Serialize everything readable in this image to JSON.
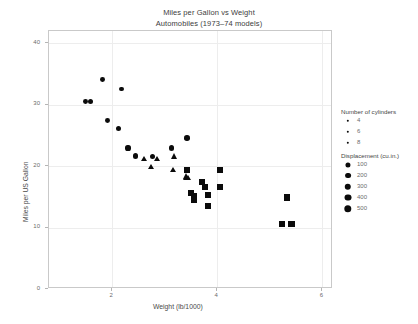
{
  "chart_data": {
    "type": "scatter",
    "title": "Miles per Gallon vs Weight",
    "subtitle": "Automobiles (1973–74 models)",
    "xlabel": "Weight (lb/1000)",
    "ylabel": "Miles per US Gallon",
    "xlim": [
      0.8,
      6.2
    ],
    "ylim": [
      0,
      42
    ],
    "xticks": [
      2,
      4,
      6
    ],
    "yticks": [
      0,
      10,
      20,
      30,
      40
    ],
    "grid": true,
    "encodings": {
      "shape": "cyl",
      "size": "disp"
    },
    "points": [
      {
        "wt": 1.513,
        "mpg": 30.4,
        "cyl": 4,
        "disp": 75.7
      },
      {
        "wt": 1.615,
        "mpg": 30.4,
        "cyl": 4,
        "disp": 95.1
      },
      {
        "wt": 1.835,
        "mpg": 33.9,
        "cyl": 4,
        "disp": 71.1
      },
      {
        "wt": 1.935,
        "mpg": 27.3,
        "cyl": 4,
        "disp": 79.0
      },
      {
        "wt": 2.14,
        "mpg": 26.0,
        "cyl": 4,
        "disp": 120.3
      },
      {
        "wt": 2.2,
        "mpg": 32.4,
        "cyl": 4,
        "disp": 78.7
      },
      {
        "wt": 2.32,
        "mpg": 22.8,
        "cyl": 4,
        "disp": 108.0
      },
      {
        "wt": 2.465,
        "mpg": 21.5,
        "cyl": 4,
        "disp": 120.1
      },
      {
        "wt": 2.62,
        "mpg": 21.0,
        "cyl": 6,
        "disp": 160.0
      },
      {
        "wt": 2.77,
        "mpg": 19.7,
        "cyl": 6,
        "disp": 145.0
      },
      {
        "wt": 2.78,
        "mpg": 21.4,
        "cyl": 4,
        "disp": 121.0
      },
      {
        "wt": 2.875,
        "mpg": 21.0,
        "cyl": 6,
        "disp": 160.0
      },
      {
        "wt": 3.15,
        "mpg": 22.8,
        "cyl": 4,
        "disp": 140.8
      },
      {
        "wt": 3.19,
        "mpg": 19.2,
        "cyl": 6,
        "disp": 167.6
      },
      {
        "wt": 3.215,
        "mpg": 21.4,
        "cyl": 6,
        "disp": 258.0
      },
      {
        "wt": 3.435,
        "mpg": 17.8,
        "cyl": 6,
        "disp": 167.6
      },
      {
        "wt": 3.44,
        "mpg": 24.4,
        "cyl": 4,
        "disp": 146.7
      },
      {
        "wt": 3.44,
        "mpg": 18.1,
        "cyl": 6,
        "disp": 225.0
      },
      {
        "wt": 3.44,
        "mpg": 19.2,
        "cyl": 8,
        "disp": 275.8
      },
      {
        "wt": 3.46,
        "mpg": 17.8,
        "cyl": 6,
        "disp": 167.6
      },
      {
        "wt": 3.52,
        "mpg": 15.5,
        "cyl": 8,
        "disp": 318.0
      },
      {
        "wt": 3.57,
        "mpg": 14.3,
        "cyl": 8,
        "disp": 360.0
      },
      {
        "wt": 3.57,
        "mpg": 15.0,
        "cyl": 8,
        "disp": 301.0
      },
      {
        "wt": 3.73,
        "mpg": 17.3,
        "cyl": 8,
        "disp": 275.8
      },
      {
        "wt": 3.78,
        "mpg": 16.4,
        "cyl": 8,
        "disp": 275.8
      },
      {
        "wt": 3.84,
        "mpg": 15.2,
        "cyl": 8,
        "disp": 304.0
      },
      {
        "wt": 3.845,
        "mpg": 13.3,
        "cyl": 8,
        "disp": 350.0
      },
      {
        "wt": 4.07,
        "mpg": 16.4,
        "cyl": 8,
        "disp": 360.0
      },
      {
        "wt": 4.07,
        "mpg": 19.2,
        "cyl": 8,
        "disp": 400.0
      },
      {
        "wt": 5.25,
        "mpg": 10.4,
        "cyl": 8,
        "disp": 460.0
      },
      {
        "wt": 5.345,
        "mpg": 14.7,
        "cyl": 8,
        "disp": 440.0
      },
      {
        "wt": 5.424,
        "mpg": 10.4,
        "cyl": 8,
        "disp": 472.0
      }
    ]
  },
  "legends": {
    "shape": {
      "title": "Number of cylinders",
      "items": [
        {
          "label": "4",
          "cyl": 4
        },
        {
          "label": "6",
          "cyl": 6
        },
        {
          "label": "8",
          "cyl": 8
        }
      ]
    },
    "size": {
      "title": "Displacement (cu.in.)",
      "items": [
        {
          "label": "100",
          "value": 100
        },
        {
          "label": "200",
          "value": 200
        },
        {
          "label": "300",
          "value": 300
        },
        {
          "label": "400",
          "value": 400
        },
        {
          "label": "500",
          "value": 500
        }
      ]
    }
  }
}
